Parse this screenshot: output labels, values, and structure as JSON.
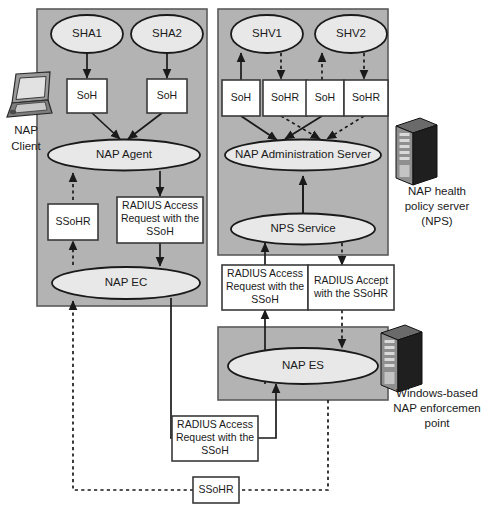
{
  "diagram": {
    "colors": {
      "panel_fill": "#b3b3b3",
      "node_fill": "#e8e8e8",
      "box_fill": "#ffffff",
      "stroke": "#1a1a1a"
    },
    "client_panel": {
      "name": "NAP Client panel",
      "nodes": {
        "sha1": "SHA1",
        "sha2": "SHA2",
        "soh_left": "SoH",
        "soh_right": "SoH",
        "nap_agent": "NAP Agent",
        "ssohr": "SSoHR",
        "radius_request": "RADIUS Access Request with the SSoH",
        "nap_ec": "NAP EC"
      }
    },
    "nps_panel": {
      "name": "NAP health policy server panel",
      "nodes": {
        "shv1": "SHV1",
        "shv2": "SHV2",
        "soh_1": "SoH",
        "sohr_1": "SoHR",
        "soh_2": "SoH",
        "sohr_2": "SoHR",
        "nap_admin_server": "NAP Administration Server",
        "nps_service": "NPS Service"
      }
    },
    "es_panel": {
      "name": "NAP enforcement server panel",
      "nodes": {
        "nap_es": "NAP ES"
      }
    },
    "messages": {
      "radius_request_mid": "RADIUS Access Request with the SSoH",
      "radius_accept_mid": "RADIUS Accept with the SSoHR",
      "radius_request_bottom": "RADIUS Access Request with the SSoH",
      "ssohr_bottom": "SSoHR"
    },
    "devices": {
      "client": {
        "icon": "laptop-icon",
        "caption_line1": "NAP",
        "caption_line2": "Client"
      },
      "nps_server": {
        "icon": "server-tower-icon",
        "caption_line1": "NAP health",
        "caption_line2": "policy server",
        "caption_line3": "(NPS)"
      },
      "enforcement_point": {
        "icon": "server-tower-icon",
        "caption_line1": "Windows-based",
        "caption_line2": "NAP enforcemen",
        "caption_line3": "point"
      }
    }
  }
}
